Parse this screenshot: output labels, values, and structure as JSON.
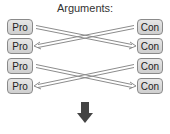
{
  "diagram": {
    "title": "Arguments:",
    "left_column": [
      {
        "label": "Pro"
      },
      {
        "label": "Pro"
      },
      {
        "label": "Pro"
      },
      {
        "label": "Pro"
      }
    ],
    "right_column": [
      {
        "label": "Con"
      },
      {
        "label": "Con"
      },
      {
        "label": "Con"
      },
      {
        "label": "Con"
      }
    ],
    "connections": [
      {
        "from": "Pro 1",
        "to": "Con 2"
      },
      {
        "from": "Con 1",
        "to": "Pro 2"
      },
      {
        "from": "Pro 3",
        "to": "Con 4"
      },
      {
        "from": "Con 3",
        "to": "Pro 4"
      }
    ],
    "bottom_arrow": "down-arrow",
    "colors": {
      "box_fill": "#d9d9d9",
      "box_border": "#8a8a8a",
      "arrow": "#8c8c8c",
      "down_arrow": "#444444"
    }
  }
}
